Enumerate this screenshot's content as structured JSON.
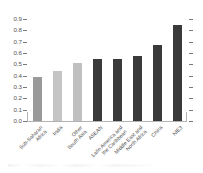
{
  "chart_data": {
    "type": "bar",
    "title": "",
    "subtitle": "",
    "xlabel": "",
    "ylabel": "",
    "ylim": [
      0.0,
      0.9
    ],
    "ytick_labels": [
      "0.0",
      "0.1",
      "0.2",
      "0.3",
      "0.4",
      "0.5",
      "0.6",
      "0.7",
      "0.8",
      "0.9"
    ],
    "ytick_values": [
      0.0,
      0.1,
      0.2,
      0.3,
      0.4,
      0.5,
      0.6,
      0.7,
      0.8,
      0.9
    ],
    "grid": false,
    "legend": "none",
    "categories": [
      "Sub-Saharan Africa",
      "India",
      "Other South Asia",
      "ASEAN",
      "Latin America and the Caribbean",
      "Middle East and North Africa",
      "China",
      "NIE3"
    ],
    "category_lines": [
      [
        "Sub-Saharan",
        "Africa"
      ],
      [
        "India"
      ],
      [
        "Other",
        "South Asia"
      ],
      [
        "ASEAN"
      ],
      [
        "Latin America and",
        "the Caribbean"
      ],
      [
        "Middle East and",
        "North Africa"
      ],
      [
        "China"
      ],
      [
        "NIE3"
      ]
    ],
    "values": [
      0.39,
      0.44,
      0.51,
      0.55,
      0.55,
      0.57,
      0.67,
      0.85
    ],
    "bar_colors": [
      "#9a9a9a",
      "#c4c4c4",
      "#c0c0c0",
      "#3a3a3a",
      "#3a3a3a",
      "#3a3a3a",
      "#3a3a3a",
      "#3a3a3a"
    ]
  },
  "axis": {
    "line_color": "#b4b4b4",
    "tick_color": "#777777",
    "label_color": "#555555"
  }
}
